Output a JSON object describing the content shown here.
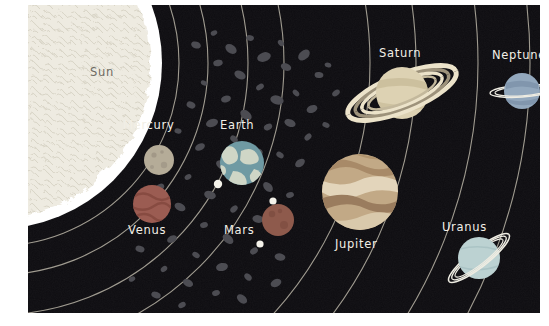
{
  "poster": {
    "title": "Solar System Illustration",
    "background_color": "#ffffff",
    "space_color": "#0d0c10",
    "label_color": "#f2efe6",
    "orbit_line_color": "#b9b4a6"
  },
  "sun": {
    "label": "Sun",
    "color": "#edeae0",
    "glow_color": "#ffffff",
    "cx": -32,
    "cy": 58,
    "r": 152
  },
  "bodies": [
    {
      "name": "Mercury",
      "label": "Mercury",
      "cx": 131,
      "cy": 155,
      "r": 15,
      "color": "#b5ac98",
      "shade": "#9a9080",
      "label_x": 95,
      "label_y": 119,
      "moons": []
    },
    {
      "name": "Venus",
      "label": "Venus",
      "cx": 124,
      "cy": 199,
      "r": 19,
      "color": "#9b5c52",
      "shade": "#84483f",
      "label_x": 100,
      "label_y": 224,
      "moons": []
    },
    {
      "name": "Earth",
      "label": "Earth",
      "cx": 214,
      "cy": 158,
      "r": 22,
      "color": "#6f9aa3",
      "shade": "#cfd6c6",
      "label_x": 192,
      "label_y": 119,
      "moons": [
        {
          "name": "Moon",
          "cx": 190,
          "cy": 179,
          "r": 4.2,
          "color": "#f4f2ea"
        }
      ]
    },
    {
      "name": "Mars",
      "label": "Mars",
      "cx": 250,
      "cy": 215,
      "r": 16,
      "color": "#8e5a4c",
      "shade": "#7a4a3e",
      "label_x": 196,
      "label_y": 224,
      "moons": [
        {
          "name": "Phobos",
          "cx": 245,
          "cy": 196,
          "r": 3.6,
          "color": "#f4f2ea"
        },
        {
          "name": "Deimos",
          "cx": 232,
          "cy": 239,
          "r": 3.6,
          "color": "#f4f2ea"
        }
      ]
    },
    {
      "name": "Jupiter",
      "label": "Jupiter",
      "cx": 332,
      "cy": 187,
      "r": 38,
      "color": "#b89a78",
      "shade": "#8f6f57",
      "label_x": 307,
      "label_y": 238,
      "moons": []
    },
    {
      "name": "Saturn",
      "label": "Saturn",
      "cx": 374,
      "cy": 88,
      "r": 26,
      "color": "#ddd2b3",
      "shade": "#bfae8a",
      "ring_color": "#ece3ca",
      "ring_dark": "#9d927b",
      "ring_tilt": -22,
      "ring_rx": 58,
      "ring_ry": 18,
      "label_x": 351,
      "label_y": 47,
      "moons": []
    },
    {
      "name": "Uranus",
      "label": "Uranus",
      "cx": 451,
      "cy": 253,
      "r": 21,
      "color": "#bcd2d2",
      "shade": "#9bb6b8",
      "ring_color": "#eeece2",
      "ring_tilt": -38,
      "ring_rx": 38,
      "ring_ry": 10,
      "label_x": 414,
      "label_y": 221,
      "moons": []
    },
    {
      "name": "Neptune",
      "label": "Neptune",
      "cx": 494,
      "cy": 86,
      "r": 18,
      "color": "#93a8bd",
      "shade": "#7b90a8",
      "ring_color": "#eeece2",
      "ring_tilt": -4,
      "ring_rx": 32,
      "ring_ry": 6,
      "label_x": 466,
      "label_y": 49,
      "moons": []
    }
  ],
  "asteroid_belt": {
    "name": "asteroid-belt",
    "color": "#4a4a4f",
    "description": "scattered irregular rocks between Mars and Jupiter"
  },
  "orbits": [
    {
      "name": "mercury-orbit",
      "r": 183
    },
    {
      "name": "venus-orbit",
      "r": 212
    },
    {
      "name": "earth-orbit",
      "r": 252
    },
    {
      "name": "mars-orbit",
      "r": 288
    },
    {
      "name": "jupiter-orbit",
      "r": 374
    },
    {
      "name": "saturn-orbit",
      "r": 420
    },
    {
      "name": "uranus-orbit",
      "r": 482
    },
    {
      "name": "neptune-orbit",
      "r": 534
    }
  ]
}
